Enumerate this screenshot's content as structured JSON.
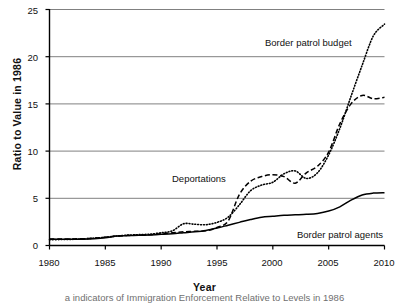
{
  "chart_data": {
    "type": "line",
    "title": "",
    "xlabel": "Year",
    "ylabel": "Ratio to Value in 1986",
    "xlim": [
      1980,
      2010
    ],
    "ylim": [
      0,
      25
    ],
    "xticks": [
      "1980",
      "1985",
      "1990",
      "1995",
      "2000",
      "2005",
      "2010"
    ],
    "yticks": [
      "0",
      "5",
      "10",
      "15",
      "20",
      "25"
    ],
    "grid": "horizontal",
    "legend_position": "inline-annotations",
    "x": [
      1980,
      1981,
      1982,
      1983,
      1984,
      1985,
      1986,
      1987,
      1988,
      1989,
      1990,
      1991,
      1992,
      1993,
      1994,
      1995,
      1996,
      1997,
      1998,
      1999,
      2000,
      2001,
      2002,
      2003,
      2004,
      2005,
      2006,
      2007,
      2008,
      2009,
      2010
    ],
    "series": [
      {
        "name": "Border patrol budget",
        "style": "dotted",
        "color": "#000000",
        "values": [
          0.62,
          0.63,
          0.65,
          0.7,
          0.78,
          0.88,
          1.0,
          1.1,
          1.15,
          1.2,
          1.35,
          1.55,
          2.3,
          2.25,
          2.2,
          2.45,
          3.0,
          4.3,
          5.8,
          6.4,
          6.7,
          7.6,
          7.9,
          7.1,
          7.7,
          9.6,
          12.4,
          15.8,
          19.1,
          22.2,
          23.45
        ]
      },
      {
        "name": "Deportations",
        "style": "dashed",
        "color": "#000000",
        "values": [
          0.7,
          0.7,
          0.7,
          0.72,
          0.78,
          0.88,
          1.0,
          1.05,
          1.1,
          1.15,
          1.25,
          1.35,
          1.45,
          1.5,
          1.55,
          1.9,
          2.6,
          5.4,
          6.8,
          7.3,
          7.5,
          7.3,
          6.6,
          7.7,
          8.4,
          9.9,
          12.9,
          15.0,
          15.9,
          15.55,
          15.7
        ]
      },
      {
        "name": "Border patrol agents",
        "style": "solid",
        "color": "#000000",
        "values": [
          0.66,
          0.66,
          0.66,
          0.67,
          0.72,
          0.82,
          1.0,
          1.05,
          1.08,
          1.12,
          1.18,
          1.25,
          1.35,
          1.45,
          1.6,
          1.85,
          2.15,
          2.45,
          2.75,
          3.0,
          3.1,
          3.2,
          3.25,
          3.3,
          3.4,
          3.65,
          4.1,
          4.8,
          5.35,
          5.55,
          5.6
        ]
      }
    ],
    "annotations": [
      {
        "text": "Border patrol budget",
        "series": "Border patrol budget"
      },
      {
        "text": "Deportations",
        "series": "Deportations"
      },
      {
        "text": "Border patrol agents",
        "series": "Border patrol agents"
      }
    ]
  },
  "caption": {
    "text": "a indicators of Immigration Enforcement Relative to Levels in 1986"
  }
}
